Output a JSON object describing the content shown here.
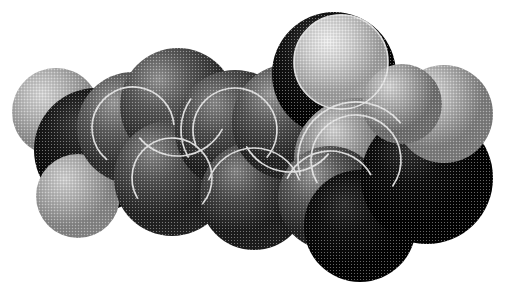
{
  "image": {
    "title": "Space-filling molecular model",
    "kind": "cpk-space-filling-model",
    "rendering": "grayscale halftone dither",
    "background_color": "#ffffff",
    "width": 505,
    "height": 288,
    "halftone": {
      "cell": 3,
      "enabled": true
    }
  },
  "palette": {
    "white": "#ffffff",
    "very_light": "#d8d8d8",
    "light": "#b4b4b4",
    "mid_light": "#969696",
    "mid": "#6e6e6e",
    "mid_dark": "#4e4e4e",
    "dark": "#2a2a2a",
    "black": "#080808",
    "outline": "#e8e8e8"
  },
  "atoms": [
    {
      "id": "h-left-upper",
      "label": "H",
      "cx": 56,
      "cy": 112,
      "r": 44,
      "base": "#b6b6b6",
      "hi": "#d9d9d9",
      "lo": "#8a8a8a",
      "z": 1,
      "hx": 0.34,
      "hy": 0.3
    },
    {
      "id": "c-left-dark",
      "label": "C",
      "cx": 96,
      "cy": 150,
      "r": 62,
      "base": "#1a1a1a",
      "hi": "#3c3c3c",
      "lo": "#050505",
      "z": 2,
      "hx": 0.36,
      "hy": 0.28
    },
    {
      "id": "h-left-lower",
      "label": "H",
      "cx": 78,
      "cy": 196,
      "r": 42,
      "base": "#b0b0b0",
      "hi": "#d2d2d2",
      "lo": "#858585",
      "z": 3,
      "hx": 0.34,
      "hy": 0.3
    },
    {
      "id": "c-ring-1",
      "label": "C",
      "cx": 133,
      "cy": 128,
      "r": 56,
      "base": "#5e5e5e",
      "hi": "#9a9a9a",
      "lo": "#2e2e2e",
      "z": 4,
      "hx": 0.33,
      "hy": 0.27
    },
    {
      "id": "c-ring-2",
      "label": "C",
      "cx": 178,
      "cy": 106,
      "r": 58,
      "base": "#575757",
      "hi": "#949494",
      "lo": "#2a2a2a",
      "z": 5,
      "hx": 0.33,
      "hy": 0.27
    },
    {
      "id": "c-ring-3",
      "label": "C",
      "cx": 172,
      "cy": 178,
      "r": 58,
      "base": "#505050",
      "hi": "#8c8c8c",
      "lo": "#232323",
      "z": 6,
      "hx": 0.33,
      "hy": 0.27
    },
    {
      "id": "c-ring-4",
      "label": "C",
      "cx": 235,
      "cy": 130,
      "r": 60,
      "base": "#4d4d4d",
      "hi": "#8a8a8a",
      "lo": "#1f1f1f",
      "z": 7,
      "hx": 0.33,
      "hy": 0.27
    },
    {
      "id": "c-ring-5",
      "label": "C",
      "cx": 254,
      "cy": 196,
      "r": 54,
      "base": "#4a4a4a",
      "hi": "#868686",
      "lo": "#1c1c1c",
      "z": 8,
      "hx": 0.33,
      "hy": 0.27
    },
    {
      "id": "c-ring-6",
      "label": "C",
      "cx": 290,
      "cy": 122,
      "r": 58,
      "base": "#565656",
      "hi": "#9c9c9c",
      "lo": "#242424",
      "z": 9,
      "hx": 0.33,
      "hy": 0.26
    },
    {
      "id": "o-dark-upper",
      "label": "O",
      "cx": 334,
      "cy": 74,
      "r": 62,
      "base": "#151515",
      "hi": "#3a3a3a",
      "lo": "#040404",
      "z": 10,
      "hx": 0.36,
      "hy": 0.28
    },
    {
      "id": "o-bright-top",
      "label": "O",
      "cx": 341,
      "cy": 62,
      "r": 47,
      "base": "#cfcfcf",
      "hi": "#efefef",
      "lo": "#9e9e9e",
      "z": 11,
      "hx": 0.36,
      "hy": 0.28
    },
    {
      "id": "c-right-light",
      "label": "C",
      "cx": 356,
      "cy": 160,
      "r": 62,
      "base": "#8e8e8e",
      "hi": "#d4d4d4",
      "lo": "#4a4a4a",
      "z": 12,
      "hx": 0.32,
      "hy": 0.26
    },
    {
      "id": "c-right-ring",
      "label": "C",
      "cx": 330,
      "cy": 198,
      "r": 52,
      "base": "#5a5a5a",
      "hi": "#9a9a9a",
      "lo": "#242424",
      "z": 13,
      "hx": 0.33,
      "hy": 0.27
    },
    {
      "id": "c-bottom-dark",
      "label": "C",
      "cx": 360,
      "cy": 226,
      "r": 56,
      "base": "#101010",
      "hi": "#2e2e2e",
      "lo": "#030303",
      "z": 14,
      "hx": 0.36,
      "hy": 0.3
    },
    {
      "id": "c-right-dark",
      "label": "C",
      "cx": 427,
      "cy": 178,
      "r": 66,
      "base": "#0e0e0e",
      "hi": "#333333",
      "lo": "#030303",
      "z": 15,
      "hx": 0.36,
      "hy": 0.28
    },
    {
      "id": "h-right-upper",
      "label": "H",
      "cx": 444,
      "cy": 114,
      "r": 49,
      "base": "#b2b2b2",
      "hi": "#dedede",
      "lo": "#7c7c7c",
      "z": 16,
      "hx": 0.34,
      "hy": 0.28
    },
    {
      "id": "h-right-edge",
      "label": "H",
      "cx": 402,
      "cy": 104,
      "r": 40,
      "base": "#a8a8a8",
      "hi": "#d6d6d6",
      "lo": "#6e6e6e",
      "z": 17,
      "hx": 0.34,
      "hy": 0.28
    }
  ],
  "seam_arcs": [
    {
      "id": "seam-ring1-inner",
      "cx": 133,
      "cy": 128,
      "r": 41,
      "a0": 205,
      "a1": 355
    },
    {
      "id": "seam-ring1-left",
      "cx": 133,
      "cy": 128,
      "r": 41,
      "a0": 130,
      "a1": 212
    },
    {
      "id": "seam-ring2-arc",
      "cx": 178,
      "cy": 106,
      "r": 50,
      "a0": 28,
      "a1": 140
    },
    {
      "id": "seam-ring3-inner",
      "cx": 172,
      "cy": 178,
      "r": 40,
      "a0": 150,
      "a1": 400
    },
    {
      "id": "seam-ring4-inner",
      "cx": 235,
      "cy": 130,
      "r": 42,
      "a0": 160,
      "a1": 400
    },
    {
      "id": "seam-ring4-left",
      "cx": 235,
      "cy": 130,
      "r": 54,
      "a0": 150,
      "a1": 215
    },
    {
      "id": "seam-ring5-arc",
      "cx": 254,
      "cy": 196,
      "r": 48,
      "a0": 200,
      "a1": 340
    },
    {
      "id": "seam-ring6-inner",
      "cx": 290,
      "cy": 122,
      "r": 50,
      "a0": 40,
      "a1": 150
    },
    {
      "id": "seam-right-inner",
      "cx": 356,
      "cy": 160,
      "r": 45,
      "a0": 150,
      "a1": 395
    },
    {
      "id": "seam-right-outer",
      "cx": 356,
      "cy": 160,
      "r": 58,
      "a0": 165,
      "a1": 320
    },
    {
      "id": "seam-rightring",
      "cx": 330,
      "cy": 198,
      "r": 47,
      "a0": 205,
      "a1": 330
    },
    {
      "id": "seam-obright",
      "cx": 341,
      "cy": 62,
      "r": 47,
      "a0": 0,
      "a1": 360
    }
  ],
  "accessibility": {
    "alt": "Grayscale halftone space-filling molecular model composed of overlapping shaded spheres",
    "caption": ""
  }
}
